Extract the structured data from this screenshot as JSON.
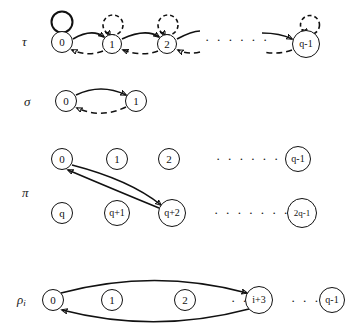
{
  "figure": {
    "width": 358,
    "height": 328,
    "background": "#ffffff",
    "ink_color": "#111111"
  },
  "rows": [
    {
      "id": "tau",
      "label": "τ",
      "label_x": 22,
      "label_y": 35,
      "nodes": [
        {
          "id": "tau-0",
          "text": "0",
          "x": 62,
          "y": 42,
          "r": 11,
          "font": 11
        },
        {
          "id": "tau-1",
          "text": "1",
          "x": 112,
          "y": 44,
          "r": 10,
          "font": 11
        },
        {
          "id": "tau-2",
          "text": "2",
          "x": 167,
          "y": 44,
          "r": 10,
          "font": 11
        },
        {
          "id": "tau-qm1",
          "text": "q-1",
          "x": 306,
          "y": 44,
          "r": 14,
          "font": 10
        }
      ],
      "dots": [
        {
          "id": "tau-ellipsis",
          "text": "· · · · · ·",
          "x": 205,
          "y": 33,
          "font": 13
        }
      ],
      "self_loops": [
        {
          "id": "tau-loop-0",
          "node": "tau-0",
          "style": "solid"
        },
        {
          "id": "tau-loop-1",
          "node": "tau-1",
          "style": "dashed"
        },
        {
          "id": "tau-loop-2",
          "node": "tau-2",
          "style": "dashed"
        },
        {
          "id": "tau-loop-qm1",
          "node": "tau-qm1",
          "style": "dashed"
        }
      ],
      "edges": [
        {
          "id": "tau-solid-0-1",
          "from": "0",
          "to": "1",
          "style": "solid",
          "direction": "forward"
        },
        {
          "id": "tau-solid-1-2",
          "from": "1",
          "to": "2",
          "style": "solid",
          "direction": "forward"
        },
        {
          "id": "tau-solid-2-q",
          "from": "2",
          "to": "…",
          "style": "solid",
          "direction": "forward"
        },
        {
          "id": "tau-solid-q-qm1",
          "from": "…",
          "to": "q-1",
          "style": "solid",
          "direction": "forward"
        },
        {
          "id": "tau-dash-1-0",
          "from": "1",
          "to": "0",
          "style": "dashed",
          "direction": "backward"
        },
        {
          "id": "tau-dash-2-1",
          "from": "2",
          "to": "1",
          "style": "dashed",
          "direction": "backward"
        },
        {
          "id": "tau-dash-3-2",
          "from": "…",
          "to": "2",
          "style": "dashed",
          "direction": "backward"
        },
        {
          "id": "tau-dash-qm1",
          "from": "q-1",
          "to": "…",
          "style": "dashed",
          "direction": "backward"
        }
      ]
    },
    {
      "id": "sigma",
      "label": "σ",
      "label_x": 24,
      "label_y": 95,
      "nodes": [
        {
          "id": "sigma-0",
          "text": "0",
          "x": 66,
          "y": 101,
          "r": 11,
          "font": 11
        },
        {
          "id": "sigma-1",
          "text": "1",
          "x": 136,
          "y": 101,
          "r": 11,
          "font": 11
        }
      ],
      "dots": [],
      "self_loops": [],
      "edges": [
        {
          "id": "sigma-solid-0-1",
          "from": "0",
          "to": "1",
          "style": "solid",
          "direction": "forward"
        },
        {
          "id": "sigma-dash-1-0",
          "from": "1",
          "to": "0",
          "style": "dashed",
          "direction": "backward"
        }
      ]
    },
    {
      "id": "pi",
      "label": "π",
      "label_x": 22,
      "label_y": 186,
      "nodes": [
        {
          "id": "pi-0",
          "text": "0",
          "x": 62,
          "y": 159,
          "r": 11,
          "font": 11
        },
        {
          "id": "pi-1",
          "text": "1",
          "x": 117,
          "y": 159,
          "r": 11,
          "font": 11
        },
        {
          "id": "pi-2",
          "text": "2",
          "x": 169,
          "y": 159,
          "r": 11,
          "font": 11
        },
        {
          "id": "pi-qm1",
          "text": "q-1",
          "x": 298,
          "y": 159,
          "r": 13,
          "font": 10
        },
        {
          "id": "pi-q",
          "text": "q",
          "x": 62,
          "y": 213,
          "r": 11,
          "font": 11
        },
        {
          "id": "pi-qp1",
          "text": "q+1",
          "x": 117,
          "y": 213,
          "r": 13,
          "font": 10
        },
        {
          "id": "pi-qp2",
          "text": "q+2",
          "x": 172,
          "y": 213,
          "r": 14,
          "font": 10
        },
        {
          "id": "pi-2qm1",
          "text": "2q-1",
          "x": 302,
          "y": 213,
          "r": 15,
          "font": 9
        }
      ],
      "dots": [
        {
          "id": "pi-ellipsis-top",
          "text": "· · · · · ·",
          "x": 216,
          "y": 152,
          "font": 13
        },
        {
          "id": "pi-ellipsis-bottom",
          "text": "· · · · · · ·",
          "x": 214,
          "y": 206,
          "font": 13
        }
      ],
      "self_loops": [],
      "edges": [
        {
          "id": "pi-solid-0-qp2",
          "from": "0",
          "to": "q+2",
          "style": "solid",
          "direction": "forward"
        },
        {
          "id": "pi-solid-qp2-0",
          "from": "q+2",
          "to": "0",
          "style": "solid",
          "direction": "forward"
        }
      ]
    },
    {
      "id": "rho",
      "label": "ρ",
      "label_sub": "i",
      "label_x": 17,
      "label_y": 293,
      "nodes": [
        {
          "id": "rho-0",
          "text": "0",
          "x": 53,
          "y": 300,
          "r": 11,
          "font": 11
        },
        {
          "id": "rho-1",
          "text": "1",
          "x": 112,
          "y": 300,
          "r": 11,
          "font": 11
        },
        {
          "id": "rho-2",
          "text": "2",
          "x": 185,
          "y": 300,
          "r": 11,
          "font": 11
        },
        {
          "id": "rho-ip3",
          "text": "i+3",
          "x": 259,
          "y": 300,
          "r": 14,
          "font": 10
        },
        {
          "id": "rho-qm1",
          "text": "q-1",
          "x": 332,
          "y": 300,
          "r": 13,
          "font": 10
        }
      ],
      "dots": [
        {
          "id": "rho-ellipsis-left",
          "text": "· · ·",
          "x": 231,
          "y": 294,
          "font": 13
        },
        {
          "id": "rho-ellipsis-right",
          "text": "· · ·",
          "x": 291,
          "y": 294,
          "font": 13
        }
      ],
      "self_loops": [],
      "edges": [
        {
          "id": "rho-solid-0-ip3",
          "from": "0",
          "to": "i+3",
          "style": "solid",
          "direction": "forward"
        },
        {
          "id": "rho-solid-ip3-0",
          "from": "i+3",
          "to": "0",
          "style": "solid",
          "direction": "forward"
        }
      ]
    }
  ]
}
